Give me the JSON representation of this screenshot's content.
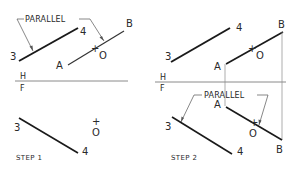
{
  "labels": {
    "parallel": "PARALLEL",
    "step1": "STEP 1",
    "step2": "STEP 2",
    "h": "H",
    "f": "F",
    "p3": "3",
    "p4": "4",
    "pA": "A",
    "pB": "B",
    "pO": "O",
    "plus": "+"
  },
  "colors": {
    "ink": "#1a1a1a",
    "thin": "#555555",
    "fold": "#8a8a8a"
  }
}
